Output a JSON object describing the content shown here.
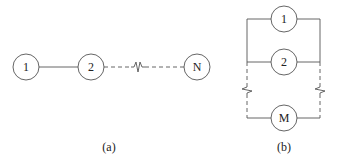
{
  "diagram_a": {
    "caption": "(a)",
    "nodes": [
      {
        "label": "1",
        "cx": 26,
        "cy": 67
      },
      {
        "label": "2",
        "cx": 91,
        "cy": 67
      },
      {
        "label": "N",
        "cx": 197,
        "cy": 67
      }
    ],
    "edges": [
      {
        "from": "1",
        "to": "2",
        "style": "solid"
      },
      {
        "from": "2",
        "to": "N",
        "style": "dashed",
        "break": true
      }
    ]
  },
  "diagram_b": {
    "caption": "(b)",
    "nodes": [
      {
        "label": "1",
        "cx": 284,
        "cy": 19
      },
      {
        "label": "2",
        "cx": 284,
        "cy": 62
      },
      {
        "label": "M",
        "cx": 284,
        "cy": 118
      }
    ],
    "topology": "parallel",
    "rails": {
      "left_x": 247,
      "right_x": 320
    }
  },
  "colors": {
    "stroke": "#555555",
    "text": "#222222",
    "background": "#ffffff"
  }
}
